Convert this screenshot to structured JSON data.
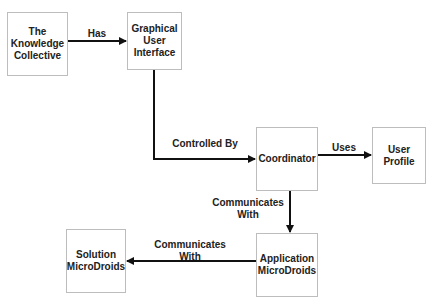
{
  "diagram": {
    "nodes": [
      {
        "id": "knowledge",
        "label": "The\nKnowledge\nCollective"
      },
      {
        "id": "gui",
        "label": "Graphical\nUser\nInterface"
      },
      {
        "id": "coordinator",
        "label": "Coordinator"
      },
      {
        "id": "profile",
        "label": "User\nProfile"
      },
      {
        "id": "solution",
        "label": "Solution\nMicroDroids"
      },
      {
        "id": "application",
        "label": "Application\nMicroDroids"
      }
    ],
    "edges": [
      {
        "from": "knowledge",
        "to": "gui",
        "label": "Has"
      },
      {
        "from": "gui",
        "to": "coordinator",
        "label": "Controlled By"
      },
      {
        "from": "coordinator",
        "to": "profile",
        "label": "Uses"
      },
      {
        "from": "coordinator",
        "to": "application",
        "label": "Communicates\nWith"
      },
      {
        "from": "application",
        "to": "solution",
        "label": "Communicates\nWith"
      }
    ]
  }
}
